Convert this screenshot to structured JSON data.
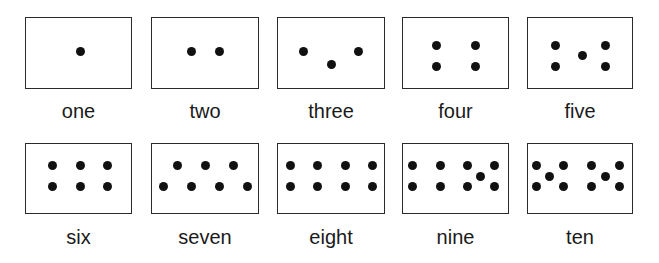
{
  "title": "",
  "cards": [
    {
      "label": "one",
      "box": [
        25,
        17,
        107,
        72
      ],
      "dots": [
        [
          80,
          51
        ]
      ]
    },
    {
      "label": "two",
      "box": [
        151,
        17,
        108,
        72
      ],
      "dots": [
        [
          191,
          51
        ],
        [
          219,
          51
        ]
      ]
    },
    {
      "label": "three",
      "box": [
        277,
        17,
        108,
        72
      ],
      "dots": [
        [
          303,
          51
        ],
        [
          331,
          64
        ],
        [
          358,
          51
        ]
      ]
    },
    {
      "label": "four",
      "box": [
        402,
        17,
        107,
        72
      ],
      "dots": [
        [
          436,
          45
        ],
        [
          475,
          45
        ],
        [
          436,
          66
        ],
        [
          475,
          66
        ]
      ]
    },
    {
      "label": "five",
      "box": [
        527,
        17,
        106,
        72
      ],
      "dots": [
        [
          555,
          45
        ],
        [
          605,
          45
        ],
        [
          582,
          55
        ],
        [
          555,
          66
        ],
        [
          605,
          66
        ]
      ]
    },
    {
      "label": "six",
      "box": [
        25,
        143,
        107,
        71
      ],
      "dots": [
        [
          52,
          165
        ],
        [
          80,
          165
        ],
        [
          107,
          165
        ],
        [
          52,
          186
        ],
        [
          80,
          186
        ],
        [
          107,
          186
        ]
      ]
    },
    {
      "label": "seven",
      "box": [
        151,
        143,
        108,
        71
      ],
      "dots": [
        [
          177,
          165
        ],
        [
          205,
          165
        ],
        [
          233,
          165
        ],
        [
          163,
          186
        ],
        [
          191,
          186
        ],
        [
          219,
          186
        ],
        [
          247,
          186
        ]
      ]
    },
    {
      "label": "eight",
      "box": [
        277,
        143,
        108,
        71
      ],
      "dots": [
        [
          290,
          165
        ],
        [
          317,
          165
        ],
        [
          345,
          165
        ],
        [
          372,
          165
        ],
        [
          290,
          186
        ],
        [
          317,
          186
        ],
        [
          345,
          186
        ],
        [
          372,
          186
        ]
      ]
    },
    {
      "label": "nine",
      "box": [
        402,
        143,
        107,
        71
      ],
      "dots": [
        [
          412,
          165
        ],
        [
          440,
          165
        ],
        [
          467,
          165
        ],
        [
          494,
          165
        ],
        [
          480,
          176
        ],
        [
          412,
          186
        ],
        [
          440,
          186
        ],
        [
          467,
          186
        ],
        [
          494,
          186
        ]
      ]
    },
    {
      "label": "ten",
      "box": [
        527,
        143,
        106,
        71
      ],
      "dots": [
        [
          536,
          165
        ],
        [
          563,
          165
        ],
        [
          591,
          165
        ],
        [
          619,
          165
        ],
        [
          549,
          176
        ],
        [
          605,
          176
        ],
        [
          536,
          186
        ],
        [
          563,
          186
        ],
        [
          591,
          186
        ],
        [
          619,
          186
        ]
      ]
    }
  ],
  "label_y": [
    111,
    237
  ]
}
